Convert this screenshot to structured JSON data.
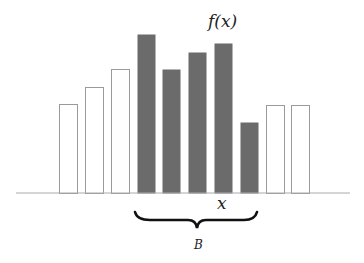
{
  "chart_data": {
    "type": "bar",
    "title": "",
    "function_label": "f(x)",
    "xlabel": "x",
    "brace_label": "B",
    "baseline_y": 193,
    "bar_width": 18,
    "grid": false,
    "bars": [
      {
        "x": 59,
        "height": 89,
        "highlighted": false
      },
      {
        "x": 85,
        "height": 106,
        "highlighted": false
      },
      {
        "x": 111,
        "height": 124,
        "highlighted": false
      },
      {
        "x": 137,
        "height": 159,
        "highlighted": true
      },
      {
        "x": 162,
        "height": 124,
        "highlighted": true
      },
      {
        "x": 188,
        "height": 141,
        "highlighted": true
      },
      {
        "x": 214,
        "height": 150,
        "highlighted": true
      },
      {
        "x": 240,
        "height": 71,
        "highlighted": true
      },
      {
        "x": 266,
        "height": 88,
        "highlighted": false
      },
      {
        "x": 291,
        "height": 88,
        "highlighted": false
      }
    ],
    "values": [
      89,
      106,
      124,
      159,
      124,
      141,
      150,
      71,
      88,
      88
    ],
    "colors": {
      "highlighted_fill": "#6b6b6b",
      "outline_stroke": "#9a9a9a",
      "axis": "#aaaaaa",
      "brace": "#111111"
    }
  },
  "labels": {
    "fx": "f(x)",
    "x": "x",
    "B": "B"
  }
}
